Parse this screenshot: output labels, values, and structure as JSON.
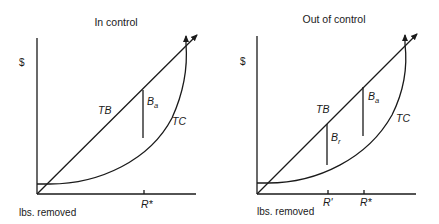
{
  "panels": [
    {
      "title": "In control",
      "y_axis_label": "$",
      "x_axis_label": "lbs. removed",
      "curves": {
        "benefit": "TB",
        "cost": "TC"
      },
      "gaps": [
        {
          "label": "B",
          "subscript": "a",
          "at": "R*"
        }
      ],
      "ticks": [
        "R*"
      ]
    },
    {
      "title": "Out of control",
      "y_axis_label": "$",
      "x_axis_label": "lbs. removed",
      "curves": {
        "benefit": "TB",
        "cost": "TC"
      },
      "gaps": [
        {
          "label": "B",
          "subscript": "r",
          "at": "R'"
        },
        {
          "label": "B",
          "subscript": "a",
          "at": "R*"
        }
      ],
      "ticks": [
        "R'",
        "R*"
      ]
    }
  ]
}
